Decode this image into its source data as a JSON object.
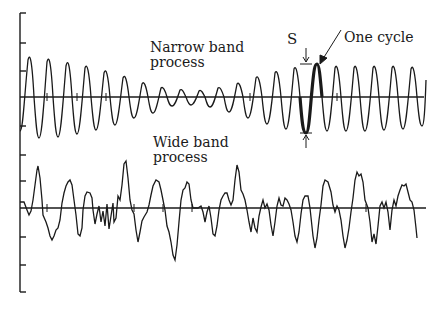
{
  "figure": {
    "narrow_band": {
      "label_line1": "Narrow band",
      "label_line2": "process"
    },
    "wide_band": {
      "label_line1": "Wide band",
      "label_line2": "process"
    },
    "annotations": {
      "amplitude_symbol": "S",
      "cycle_label": "One cycle"
    },
    "colors": {
      "ink": "#1a1a1a",
      "background": "#ffffff"
    }
  }
}
